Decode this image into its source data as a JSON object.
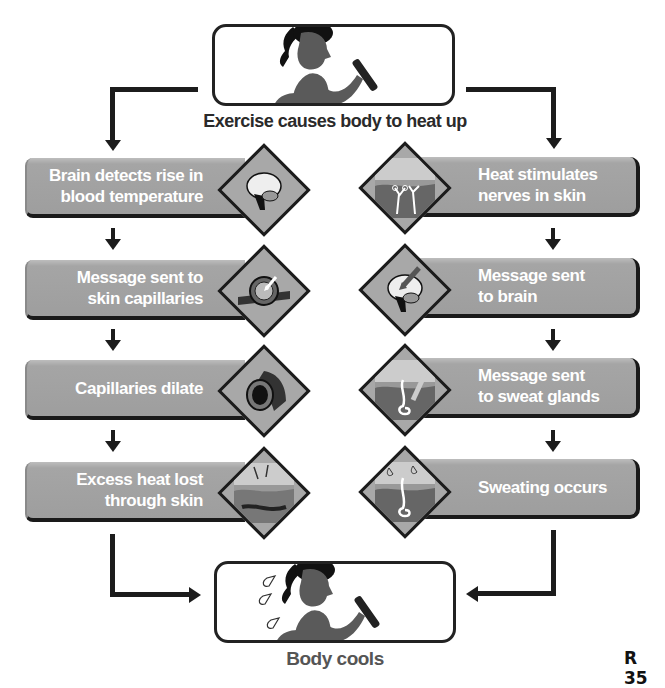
{
  "start": {
    "caption": "Exercise causes body to heat up",
    "image": "girl-running-icon"
  },
  "left_column": {
    "steps": [
      {
        "label_lines": [
          "Brain detects rise in",
          "blood temperature"
        ],
        "icon": "brain-icon"
      },
      {
        "label_lines": [
          "Message sent to",
          "skin capillaries"
        ],
        "icon": "capillary-cross-section-icon"
      },
      {
        "label_lines": [
          "Capillaries dilate"
        ],
        "icon": "dilated-vessel-icon"
      },
      {
        "label_lines": [
          "Excess heat lost",
          "through skin"
        ],
        "icon": "skin-heat-loss-icon"
      }
    ]
  },
  "right_column": {
    "steps": [
      {
        "label_lines": [
          "Heat stimulates",
          "nerves in skin"
        ],
        "icon": "skin-nerves-icon"
      },
      {
        "label_lines": [
          "Message sent",
          "to brain"
        ],
        "icon": "brain-arrow-icon"
      },
      {
        "label_lines": [
          "Message sent",
          "to sweat glands"
        ],
        "icon": "sweat-gland-arrow-icon"
      },
      {
        "label_lines": [
          "Sweating occurs"
        ],
        "icon": "sweat-gland-droplets-icon"
      }
    ]
  },
  "end": {
    "caption": "Body cools",
    "image": "girl-running-sweating-icon"
  },
  "page_number": "R 35",
  "colors": {
    "step_fill": "#a3a3a3",
    "step_text": "#ffffff",
    "arrows": "#1c1c1c",
    "caption_text": "#2a2a2a"
  }
}
